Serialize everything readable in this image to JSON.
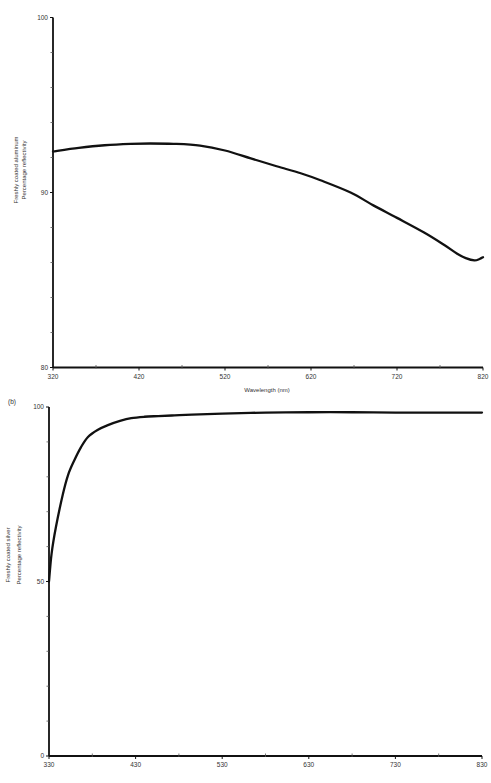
{
  "chart_data": [
    {
      "type": "line",
      "panel_label": "",
      "title": "",
      "xlabel": "Wavelength (nm)",
      "ylabel_line1": "Freshly coated aluminum",
      "ylabel_line2": "Percentage reflectivity",
      "xlim": [
        320,
        820
      ],
      "ylim": [
        80,
        100
      ],
      "grid": false,
      "legend": "none",
      "x_ticks": [
        320,
        420,
        520,
        620,
        720,
        820
      ],
      "x_tick_labels": [
        "320",
        "420",
        "520",
        "620",
        "720",
        "820"
      ],
      "x_minor_ticks": [
        370,
        470,
        570,
        670,
        770
      ],
      "y_ticks": [
        80,
        90,
        100
      ],
      "y_tick_labels": [
        "80",
        "90",
        "100"
      ],
      "y_minor_ticks": [
        82,
        84,
        86,
        88,
        92,
        94,
        96,
        98
      ],
      "series": [
        {
          "name": "Freshly coated aluminum",
          "color": "#111111",
          "x": [
            320,
            350,
            380,
            410,
            433,
            460,
            491,
            520,
            550,
            580,
            608,
            631,
            666,
            693,
            720,
            752,
            775,
            790,
            800,
            810,
            816,
            820
          ],
          "y": [
            92.35,
            92.55,
            92.7,
            92.78,
            92.8,
            92.78,
            92.68,
            92.4,
            91.95,
            91.5,
            91.1,
            90.7,
            90.0,
            89.25,
            88.55,
            87.7,
            87.0,
            86.5,
            86.25,
            86.12,
            86.2,
            86.3
          ]
        }
      ]
    },
    {
      "type": "line",
      "panel_label": "(b)",
      "title": "",
      "xlabel": "",
      "ylabel_line1": "Freshly coated silver",
      "ylabel_line2": "Percentage reflectivity",
      "xlim": [
        330,
        830
      ],
      "ylim": [
        0,
        100
      ],
      "grid": false,
      "legend": "none",
      "x_ticks": [
        330,
        430,
        530,
        630,
        730,
        830
      ],
      "x_tick_labels": [
        "330",
        "430",
        "530",
        "630",
        "730",
        "830"
      ],
      "x_minor_ticks": [
        380,
        480,
        580,
        680,
        780
      ],
      "y_ticks": [
        0,
        50,
        100
      ],
      "y_tick_labels": [
        "0",
        "50",
        "100"
      ],
      "y_minor_ticks": [
        10,
        20,
        30,
        40,
        60,
        70,
        80,
        90
      ],
      "series": [
        {
          "name": "Freshly coated silver",
          "color": "#111111",
          "x": [
            330,
            333,
            338,
            346,
            352,
            359,
            367,
            375,
            386,
            398,
            412,
            425,
            440,
            456,
            475,
            495,
            530,
            580,
            630,
            680,
            730,
            780,
            830
          ],
          "y": [
            50,
            58,
            65.6,
            75,
            80.5,
            84.6,
            88.5,
            91.4,
            93.4,
            94.8,
            96.0,
            96.8,
            97.2,
            97.4,
            97.6,
            97.8,
            98.1,
            98.4,
            98.5,
            98.5,
            98.4,
            98.4,
            98.4
          ]
        }
      ]
    }
  ]
}
